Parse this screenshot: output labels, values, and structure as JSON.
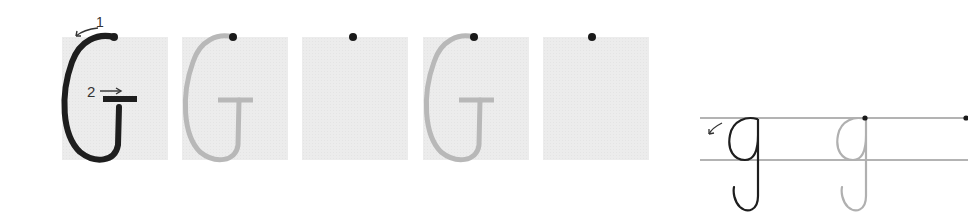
{
  "worksheet": {
    "letter_upper": "G",
    "letter_lower": "g",
    "stroke_labels": {
      "first": "1",
      "second": "2"
    },
    "arrows": {
      "first": "↙",
      "second": "→",
      "lowercase_start": "↙"
    },
    "upper_boxes": [
      {
        "index": 1,
        "variant": "model-dark"
      },
      {
        "index": 2,
        "variant": "trace-grey"
      },
      {
        "index": 3,
        "variant": "blank-with-start-dot"
      },
      {
        "index": 4,
        "variant": "trace-grey"
      },
      {
        "index": 5,
        "variant": "blank-with-start-dot"
      }
    ],
    "lower_row": [
      {
        "index": 1,
        "variant": "model-dark"
      },
      {
        "index": 2,
        "variant": "trace-grey"
      },
      {
        "index": 3,
        "variant": "start-dot"
      }
    ],
    "colors": {
      "box_fill": "#ececec",
      "dark_stroke": "#1e1e1e",
      "trace_stroke": "#b8b8b8",
      "guide_line": "#9a9a9a",
      "dot": "#1a1a1a"
    }
  }
}
